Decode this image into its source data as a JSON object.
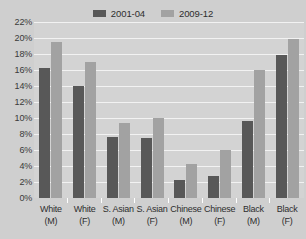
{
  "chart_data": {
    "type": "bar",
    "title": "",
    "subtitle": "",
    "xlabel": "",
    "ylabel": "",
    "ylim": [
      0,
      22
    ],
    "ytick_labels": [
      "22%",
      "20%",
      "18%",
      "16%",
      "14%",
      "12%",
      "10%",
      "8%",
      "6%",
      "4%",
      "2%",
      "0%"
    ],
    "ytick_values": [
      22,
      20,
      18,
      16,
      14,
      12,
      10,
      8,
      6,
      4,
      2,
      0
    ],
    "grid": true,
    "legend_position": "top-center",
    "categories": [
      "White (M)",
      "White (F)",
      "S. Asian (M)",
      "S. Asian (F)",
      "Chinese (M)",
      "Chinese (F)",
      "Black (M)",
      "Black (F)"
    ],
    "category_lines": [
      [
        "White",
        "(M)"
      ],
      [
        "White",
        "(F)"
      ],
      [
        "S. Asian",
        "(M)"
      ],
      [
        "S. Asian",
        "(F)"
      ],
      [
        "Chinese",
        "(M)"
      ],
      [
        "Chinese",
        "(F)"
      ],
      [
        "Black",
        "(M)"
      ],
      [
        "Black",
        "(F)"
      ]
    ],
    "series": [
      {
        "name": "2001-04",
        "color": "#585858",
        "values": [
          16.3,
          14.0,
          7.6,
          7.5,
          2.3,
          2.7,
          9.6,
          17.9
        ]
      },
      {
        "name": "2009-12",
        "color": "#a2a2a2",
        "values": [
          19.5,
          17.0,
          9.4,
          10.0,
          4.2,
          6.0,
          16.0,
          19.9
        ]
      }
    ]
  },
  "legend": {
    "entries": [
      {
        "label": "2001-04",
        "color": "#585858"
      },
      {
        "label": "2009-12",
        "color": "#a2a2a2"
      }
    ]
  },
  "colors": {
    "page_background": "#cfcfcf",
    "plot_background": "#d3d3d3",
    "gridline": "#f2f2f2",
    "series_1": "#585858",
    "series_2": "#a2a2a2",
    "text": "#2e2e2e"
  }
}
